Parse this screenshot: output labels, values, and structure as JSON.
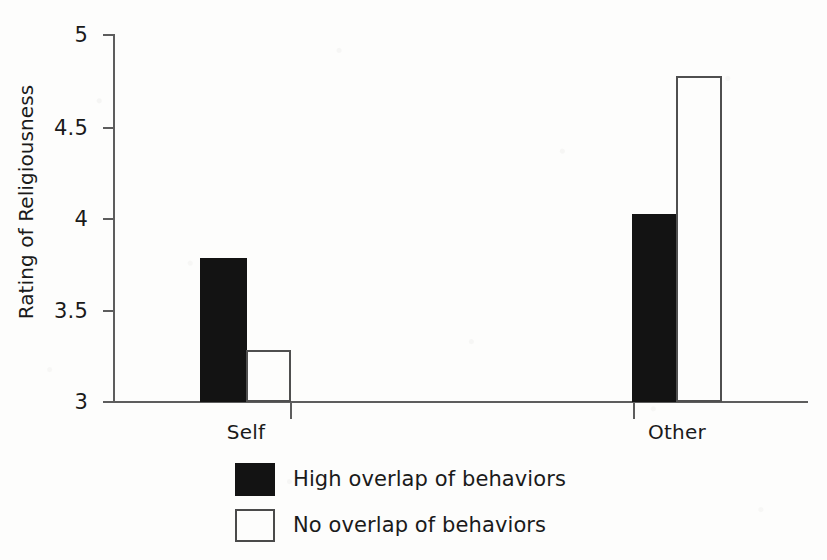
{
  "chart_data": {
    "type": "bar",
    "title": "",
    "xlabel": "",
    "ylabel": "Rating of Religiousness",
    "categories": [
      "Self",
      "Other"
    ],
    "ylim": [
      3,
      5
    ],
    "yticks": [
      "3",
      "3.5",
      "4",
      "4.5",
      "5"
    ],
    "ytick_values": [
      3,
      3.5,
      4,
      4.5,
      5
    ],
    "grid": false,
    "legend_position": "bottom-left",
    "series": [
      {
        "name": "High overlap of behaviors",
        "style": "filled",
        "color": "#131313",
        "values": [
          3.78,
          4.02
        ]
      },
      {
        "name": "No overlap of behaviors",
        "style": "hollow",
        "color": "#ffffff",
        "values": [
          3.28,
          4.77
        ]
      }
    ]
  },
  "axes": {
    "y_title": "Rating of Religiousness",
    "y_tick_labels": [
      "5",
      "4.5",
      "4",
      "3.5",
      "3"
    ],
    "x_tick_labels": [
      "Self",
      "Other"
    ]
  },
  "legend": {
    "items": [
      {
        "label": "High overlap of behaviors",
        "style": "filled"
      },
      {
        "label": "No overlap of behaviors",
        "style": "hollow"
      }
    ]
  },
  "colors": {
    "ink": "#131313",
    "axis": "#5d5d5d",
    "paper": "#fdfdfc"
  }
}
